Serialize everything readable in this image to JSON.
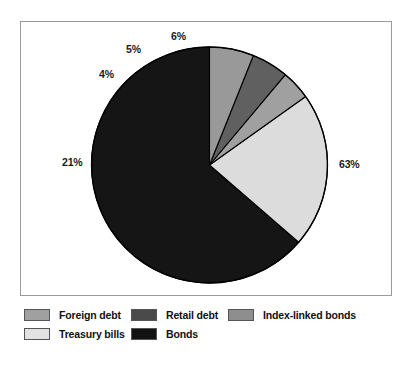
{
  "chart_data": {
    "type": "pie",
    "title": "",
    "xlabel": "",
    "ylabel": "",
    "start_angle_deg": 90,
    "direction": "counterclockwise",
    "legend_position": "bottom",
    "grid": false,
    "categories": [
      "Bonds",
      "Treasury bills",
      "Foreign debt",
      "Retail debt",
      "Index-linked bonds"
    ],
    "values": [
      63,
      21,
      4,
      5,
      6
    ],
    "labels": [
      "63%",
      "21%",
      "4%",
      "5%",
      "6%"
    ],
    "colors": [
      "#151515",
      "#dcdcdc",
      "#a0a0a0",
      "#606060",
      "#999999"
    ],
    "slices": [
      {
        "label": "Bonds",
        "value": 63,
        "display": "63%",
        "color": "#151515"
      },
      {
        "label": "Treasury bills",
        "value": 21,
        "display": "21%",
        "color": "#dcdcdc"
      },
      {
        "label": "Foreign debt",
        "value": 4,
        "display": "4%",
        "color": "#a0a0a0"
      },
      {
        "label": "Retail debt",
        "value": 5,
        "display": "5%",
        "color": "#606060"
      },
      {
        "label": "Index-linked bonds",
        "value": 6,
        "display": "6%",
        "color": "#999999"
      }
    ]
  },
  "plot": {
    "pct_labels": [
      {
        "text": "63%",
        "x": 339,
        "y": 158
      },
      {
        "text": "21%",
        "x": 62,
        "y": 156
      },
      {
        "text": "4%",
        "x": 99,
        "y": 68
      },
      {
        "text": "5%",
        "x": 126,
        "y": 43
      },
      {
        "text": "6%",
        "x": 171,
        "y": 30
      }
    ]
  },
  "legend": {
    "rows": [
      [
        {
          "label": "Foreign debt",
          "color": "#a0a0a0"
        },
        {
          "label": "Retail debt",
          "color": "#4a4a4a"
        },
        {
          "label": "Index-linked bonds",
          "color": "#8e8e8e"
        }
      ],
      [
        {
          "label": "Treasury bills",
          "color": "#e2e2e2"
        },
        {
          "label": "Bonds",
          "color": "#121212"
        }
      ]
    ]
  }
}
